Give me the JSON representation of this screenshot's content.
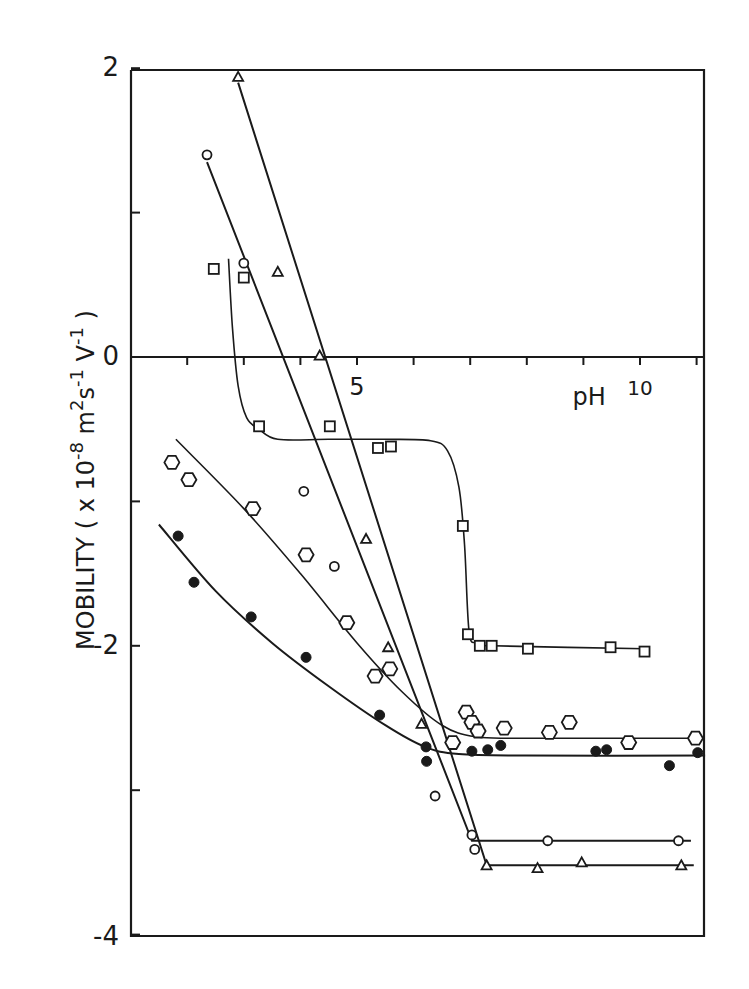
{
  "chart_data": {
    "type": "scatter",
    "title": "",
    "xlabel": "pH",
    "ylabel": "MOBILITY ( x 10^-8 m^2 s^-1 V^-1 )",
    "ylabel_parts": {
      "main": "MOBILITY ( x 10",
      "exp1": "-8",
      "m": " m",
      "exp2": "2",
      "s": "s",
      "exp3": "-1",
      "v": " V",
      "exp4": "-1",
      "close": " )"
    },
    "xlim": [
      1.0,
      11.15
    ],
    "ylim": [
      -4,
      2
    ],
    "x_ticks": [
      2,
      3,
      4,
      5,
      6,
      7,
      8,
      9,
      10,
      11
    ],
    "x_tick_labels": [
      {
        "value": 5,
        "label": "5"
      },
      {
        "value": 10,
        "label": "10"
      }
    ],
    "y_ticks": [
      2,
      1,
      0,
      -1,
      -2,
      -3,
      -4
    ],
    "y_tick_labels": [
      {
        "value": 2,
        "label": "2"
      },
      {
        "value": 0,
        "label": "0"
      },
      {
        "value": -2,
        "label": "-2"
      },
      {
        "value": -4,
        "label": "-4"
      }
    ],
    "x_axis_position": "y=0",
    "grid": false,
    "legend": null,
    "series": [
      {
        "name": "squares",
        "marker": "square",
        "points": [
          [
            2.47,
            0.61
          ],
          [
            3.0,
            0.55
          ],
          [
            3.27,
            -0.48
          ],
          [
            4.52,
            -0.48
          ],
          [
            5.37,
            -0.63
          ],
          [
            5.6,
            -0.62
          ],
          [
            6.87,
            -1.17
          ],
          [
            6.96,
            -1.92
          ],
          [
            7.17,
            -2.0
          ],
          [
            7.38,
            -2.0
          ],
          [
            8.02,
            -2.02
          ],
          [
            9.48,
            -2.01
          ],
          [
            10.08,
            -2.04
          ]
        ],
        "curve": [
          [
            2.73,
            0.68
          ],
          [
            2.8,
            0.2
          ],
          [
            2.9,
            -0.2
          ],
          [
            3.05,
            -0.42
          ],
          [
            3.27,
            -0.5
          ],
          [
            3.6,
            -0.57
          ],
          [
            4.5,
            -0.57
          ],
          [
            5.5,
            -0.57
          ],
          [
            6.3,
            -0.58
          ],
          [
            6.6,
            -0.65
          ],
          [
            6.8,
            -0.9
          ],
          [
            6.9,
            -1.3
          ],
          [
            6.98,
            -1.9
          ],
          [
            7.12,
            -1.98
          ],
          [
            7.4,
            -2.0
          ],
          [
            10.08,
            -2.02
          ]
        ]
      },
      {
        "name": "open circles",
        "marker": "circle",
        "points": [
          [
            2.35,
            1.4
          ],
          [
            3.0,
            0.65
          ],
          [
            4.06,
            -0.93
          ],
          [
            4.6,
            -1.45
          ],
          [
            6.38,
            -3.04
          ],
          [
            7.03,
            -3.31
          ],
          [
            7.08,
            -3.41
          ],
          [
            8.37,
            -3.35
          ],
          [
            10.68,
            -3.35
          ]
        ],
        "curve": [
          [
            2.35,
            1.35
          ],
          [
            7.03,
            -3.35
          ],
          [
            10.9,
            -3.35
          ]
        ]
      },
      {
        "name": "triangles",
        "marker": "triangle",
        "points": [
          [
            2.9,
            1.94
          ],
          [
            3.6,
            0.59
          ],
          [
            4.34,
            0.01
          ],
          [
            5.16,
            -1.26
          ],
          [
            5.55,
            -2.01
          ],
          [
            6.14,
            -2.54
          ],
          [
            7.29,
            -3.52
          ],
          [
            8.19,
            -3.54
          ],
          [
            8.97,
            -3.5
          ],
          [
            10.73,
            -3.52
          ]
        ],
        "curve": [
          [
            2.9,
            1.9
          ],
          [
            7.29,
            -3.52
          ],
          [
            10.95,
            -3.52
          ]
        ]
      },
      {
        "name": "hexagons",
        "marker": "hexagon",
        "points": [
          [
            1.73,
            -0.73
          ],
          [
            2.03,
            -0.85
          ],
          [
            3.16,
            -1.05
          ],
          [
            4.1,
            -1.37
          ],
          [
            4.82,
            -1.84
          ],
          [
            5.32,
            -2.21
          ],
          [
            5.58,
            -2.16
          ],
          [
            6.69,
            -2.67
          ],
          [
            6.93,
            -2.46
          ],
          [
            7.03,
            -2.53
          ],
          [
            7.14,
            -2.59
          ],
          [
            7.6,
            -2.57
          ],
          [
            8.4,
            -2.6
          ],
          [
            8.75,
            -2.53
          ],
          [
            9.8,
            -2.67
          ],
          [
            10.98,
            -2.64
          ]
        ],
        "curve": [
          [
            1.8,
            -0.57
          ],
          [
            3.0,
            -1.05
          ],
          [
            4.0,
            -1.5
          ],
          [
            5.0,
            -1.98
          ],
          [
            5.8,
            -2.32
          ],
          [
            6.5,
            -2.55
          ],
          [
            7.1,
            -2.63
          ],
          [
            8.0,
            -2.64
          ],
          [
            11.0,
            -2.64
          ]
        ]
      },
      {
        "name": "filled circles",
        "marker": "filled-circle",
        "points": [
          [
            1.84,
            -1.24
          ],
          [
            2.12,
            -1.56
          ],
          [
            3.13,
            -1.8
          ],
          [
            4.1,
            -2.08
          ],
          [
            5.4,
            -2.48
          ],
          [
            6.22,
            -2.7
          ],
          [
            6.23,
            -2.8
          ],
          [
            7.03,
            -2.73
          ],
          [
            7.31,
            -2.72
          ],
          [
            7.54,
            -2.69
          ],
          [
            9.22,
            -2.73
          ],
          [
            9.41,
            -2.72
          ],
          [
            10.52,
            -2.83
          ],
          [
            11.02,
            -2.74
          ]
        ],
        "curve": [
          [
            1.5,
            -1.16
          ],
          [
            2.5,
            -1.62
          ],
          [
            3.5,
            -1.98
          ],
          [
            4.5,
            -2.28
          ],
          [
            5.5,
            -2.55
          ],
          [
            6.2,
            -2.7
          ],
          [
            6.8,
            -2.75
          ],
          [
            8.0,
            -2.76
          ],
          [
            11.15,
            -2.76
          ]
        ]
      }
    ]
  },
  "layout": {
    "plot_px": {
      "left": 131,
      "right": 704,
      "top": 70,
      "bottom": 936
    },
    "x_map": {
      "origin_px": 74,
      "px_per_unit": 56.6
    },
    "y_map": {
      "zero_px": 357,
      "px_per_unit": 144.4
    },
    "colors": {
      "ink": "#1a1a1a",
      "background": "#ffffff"
    }
  }
}
